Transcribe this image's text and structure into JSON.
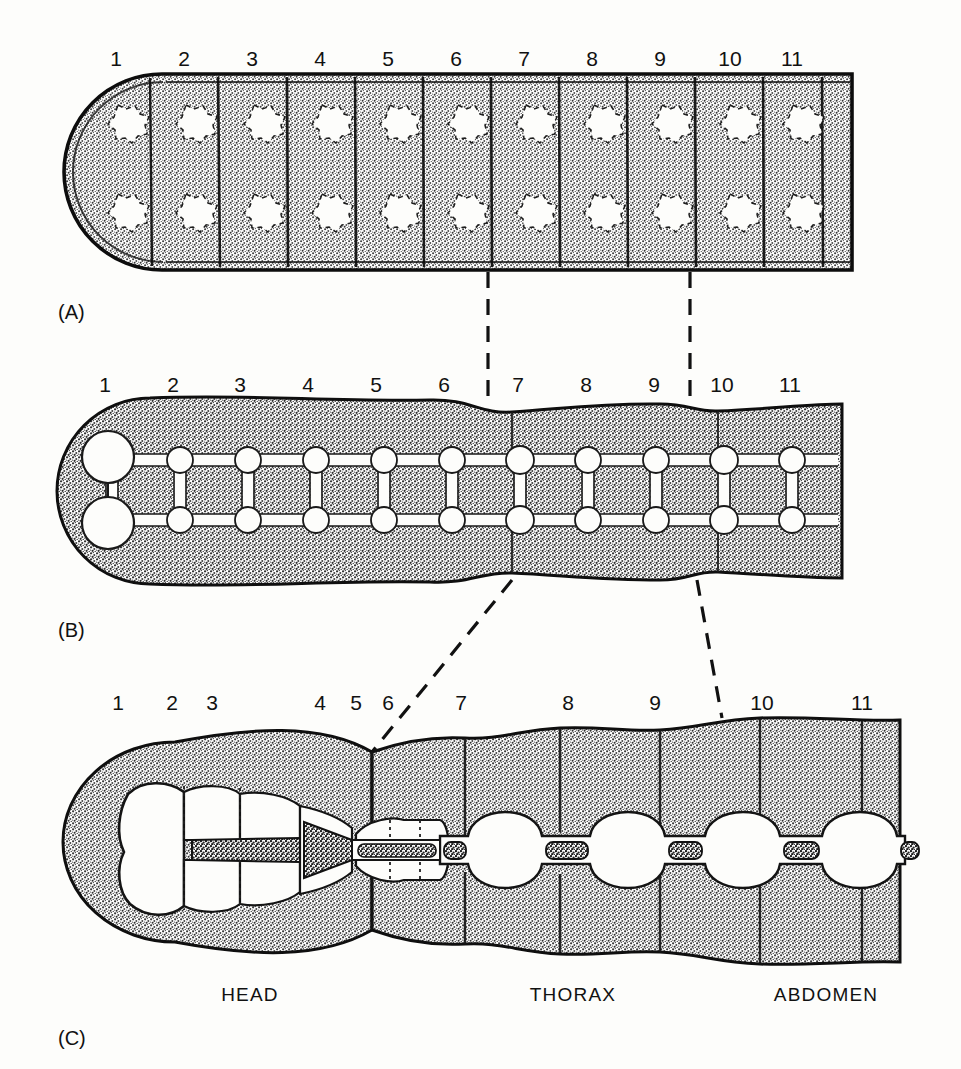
{
  "figure": {
    "title_present": false,
    "background_color": "#fdfdfb",
    "ink_color": "#111111",
    "stipple_color": "#4a4a4a"
  },
  "panels": [
    {
      "id": "A",
      "label": "(A)",
      "description": "generalized segmented body, uniform repeated segments with paired lateral spots",
      "segment_numbers": [
        "1",
        "2",
        "3",
        "4",
        "5",
        "6",
        "7",
        "8",
        "9",
        "10",
        "11"
      ],
      "number_x": [
        116,
        184,
        252,
        320,
        388,
        456,
        524,
        592,
        660,
        728,
        790
      ],
      "number_y": 44,
      "label_x": 58,
      "label_y": 302,
      "body": {
        "x_left": 64,
        "x_right": 852,
        "y_top": 74,
        "y_bottom": 270,
        "segment_count": 11,
        "spot_rows": 2,
        "spots_per_row": 11
      }
    },
    {
      "id": "B",
      "label": "(B)",
      "description": "ladder-like ventral nerve cord with paired ganglia in each segment",
      "segment_numbers": [
        "1",
        "2",
        "3",
        "4",
        "5",
        "6",
        "7",
        "8",
        "9",
        "10",
        "11"
      ],
      "number_x": [
        105,
        173,
        240,
        308,
        376,
        444,
        512,
        580,
        648,
        716,
        784
      ],
      "number_y": 370,
      "label_x": 58,
      "label_y": 620,
      "body": {
        "x_left": 60,
        "x_right": 842,
        "y_top": 398,
        "y_bottom": 580,
        "ganglia_pairs": 11
      }
    },
    {
      "id": "C",
      "label": "(C)",
      "description": "specialized insect body: fused head ganglia, thoracic and abdominal ganglia",
      "segment_numbers": [
        "1",
        "2",
        "3",
        "4",
        "5",
        "6",
        "7",
        "8",
        "9",
        "10",
        "11"
      ],
      "number_x": [
        118,
        170,
        210,
        320,
        355,
        385,
        460,
        568,
        655,
        760,
        862
      ],
      "number_y": 688,
      "label_x": 58,
      "label_y": 1028,
      "body": {
        "x_left": 60,
        "x_right": 900,
        "y_top": 716,
        "y_bottom": 966
      },
      "region_labels": [
        {
          "text": "HEAD",
          "x": 250,
          "y": 985
        },
        {
          "text": "THORAX",
          "x": 573,
          "y": 985
        },
        {
          "text": "ABDOMEN",
          "x": 826,
          "y": 985
        }
      ]
    }
  ],
  "connectors": [
    {
      "name": "a-to-b-left",
      "from_x": 488,
      "from_y": 272,
      "to_x": 488,
      "to_y": 400,
      "style": "dashed-vertical"
    },
    {
      "name": "a-to-b-right",
      "from_x": 690,
      "from_y": 272,
      "to_x": 690,
      "to_y": 400,
      "style": "dashed-vertical"
    },
    {
      "name": "b-to-c-left",
      "from_x": 512,
      "from_y": 578,
      "to_x": 372,
      "to_y": 752,
      "style": "dashed-diagonal"
    },
    {
      "name": "b-to-c-right",
      "from_x": 697,
      "from_y": 578,
      "to_x": 722,
      "to_y": 718,
      "style": "dashed-diagonal"
    }
  ]
}
